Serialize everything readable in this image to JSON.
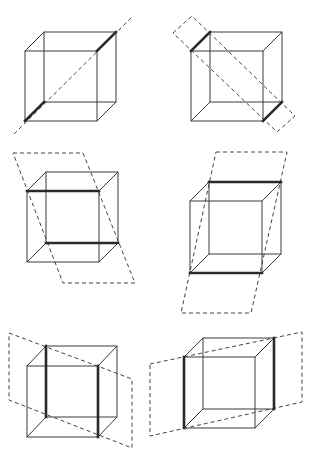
{
  "diagram": {
    "title": "",
    "colors": {
      "background": "#ffffff",
      "edge": "#3a3a3a",
      "highlight": "#2a2a2a",
      "plane": "#444444"
    },
    "cubes": [
      {
        "id": "cube-1",
        "front": [
          25,
          51,
          97,
          121
        ],
        "offset": [
          19,
          -19
        ],
        "highlight_edges": [
          [
            97,
            51,
            116,
            32
          ],
          [
            25,
            121,
            44,
            102
          ]
        ],
        "plane": {
          "type": "line",
          "points": [
            [
              14,
              134
            ],
            [
              133,
              16
            ]
          ]
        }
      },
      {
        "id": "cube-2",
        "front": [
          191,
          51,
          263,
          121
        ],
        "offset": [
          19,
          -19
        ],
        "highlight_edges": [
          [
            191,
            51,
            210,
            32
          ],
          [
            263,
            121,
            282,
            102
          ]
        ],
        "plane": {
          "type": "polygon",
          "points": [
            [
              173,
              33
            ],
            [
              192,
              16
            ],
            [
              295,
              116
            ],
            [
              277,
              132
            ]
          ]
        }
      },
      {
        "id": "cube-3",
        "front": [
          27,
          191,
          99,
          262
        ],
        "offset": [
          19,
          -19
        ],
        "highlight_edges": [
          [
            27,
            191,
            99,
            191
          ],
          [
            46,
            243,
            118,
            243
          ]
        ],
        "plane": {
          "type": "polygon",
          "points": [
            [
              13,
              153
            ],
            [
              83,
              153
            ],
            [
              135,
              283
            ],
            [
              63,
              283
            ]
          ]
        }
      },
      {
        "id": "cube-4",
        "front": [
          190,
          201,
          262,
          273
        ],
        "offset": [
          19,
          -19
        ],
        "highlight_edges": [
          [
            209,
            182,
            281,
            182
          ],
          [
            190,
            273,
            262,
            273
          ]
        ],
        "plane": {
          "type": "polygon",
          "points": [
            [
              216,
              152
            ],
            [
              287,
              152
            ],
            [
              251,
              313
            ],
            [
              181,
              313
            ]
          ]
        }
      },
      {
        "id": "cube-5",
        "front": [
          27,
          366,
          98,
          437
        ],
        "offset": [
          19,
          -20
        ],
        "highlight_edges": [
          [
            46,
            346,
            46,
            417
          ],
          [
            98,
            366,
            98,
            437
          ]
        ],
        "plane": {
          "type": "polygon",
          "points": [
            [
              9,
              333
            ],
            [
              132,
              379
            ],
            [
              132,
              448
            ],
            [
              9,
              400
            ]
          ]
        }
      },
      {
        "id": "cube-6",
        "front": [
          184,
          357,
          255,
          428
        ],
        "offset": [
          19,
          -19
        ],
        "highlight_edges": [
          [
            184,
            357,
            184,
            428
          ],
          [
            274,
            338,
            274,
            409
          ]
        ],
        "plane": {
          "type": "polygon",
          "points": [
            [
              150,
              364
            ],
            [
              302,
              332
            ],
            [
              302,
              402
            ],
            [
              150,
              436
            ]
          ]
        }
      }
    ]
  }
}
